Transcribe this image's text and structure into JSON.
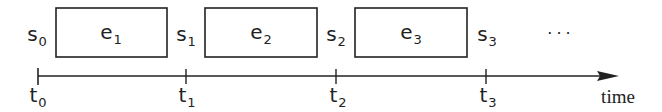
{
  "diagram": {
    "states": [
      {
        "base": "s",
        "sub": "0"
      },
      {
        "base": "s",
        "sub": "1"
      },
      {
        "base": "s",
        "sub": "2"
      },
      {
        "base": "s",
        "sub": "3"
      }
    ],
    "events": [
      {
        "base": "e",
        "sub": "1"
      },
      {
        "base": "e",
        "sub": "2"
      },
      {
        "base": "e",
        "sub": "3"
      }
    ],
    "ticks": [
      {
        "base": "t",
        "sub": "0"
      },
      {
        "base": "t",
        "sub": "1"
      },
      {
        "base": "t",
        "sub": "2"
      },
      {
        "base": "t",
        "sub": "3"
      }
    ],
    "ellipsis": "···",
    "axis_label": "time",
    "colors": {
      "stroke": "#222222",
      "text": "#222222",
      "background": "#ffffff"
    }
  }
}
